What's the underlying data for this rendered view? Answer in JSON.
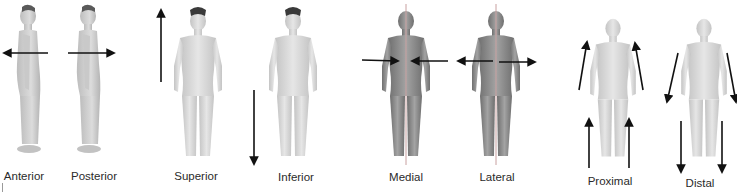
{
  "diagram": {
    "colors": {
      "light_skin": "#d9d9d9",
      "light_skin_shade": "#b8b8b8",
      "dark_skin": "#8f8f8f",
      "dark_skin_shade": "#6e6e6e",
      "hair": "#3a3a3a",
      "arrow": "#111111",
      "midline": "#c8a0a0"
    },
    "panels": [
      {
        "term": "Anterior",
        "view": "side",
        "arrow": "left-horizontal"
      },
      {
        "term": "Posterior",
        "view": "side",
        "arrow": "right-horizontal"
      },
      {
        "term": "Superior",
        "view": "front-male",
        "arrow": "up-vertical"
      },
      {
        "term": "Inferior",
        "view": "front-male",
        "arrow": "down-vertical"
      },
      {
        "term": "Medial",
        "view": "front-female-dark",
        "arrow": "inward-horizontal-pair"
      },
      {
        "term": "Lateral",
        "view": "front-female-dark",
        "arrow": "outward-horizontal-pair"
      },
      {
        "term": "Proximal",
        "view": "front-female",
        "arrow": "up-along-limbs"
      },
      {
        "term": "Distal",
        "view": "front-female",
        "arrow": "down-along-limbs"
      }
    ]
  }
}
